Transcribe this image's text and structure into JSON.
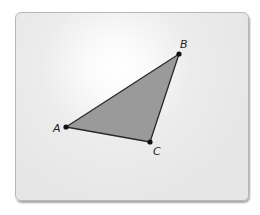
{
  "figure": {
    "type": "triangle",
    "fill_color": "#9a9a9a",
    "stroke_color": "#2a2a2a",
    "vertices": [
      {
        "name": "A",
        "x": 66,
        "y": 127,
        "label": "A",
        "label_x": 53,
        "label_y": 132
      },
      {
        "name": "B",
        "x": 179,
        "y": 54,
        "label": "B",
        "label_x": 180,
        "label_y": 48
      },
      {
        "name": "C",
        "x": 150,
        "y": 142,
        "label": "C",
        "label_x": 153,
        "label_y": 155
      }
    ]
  }
}
